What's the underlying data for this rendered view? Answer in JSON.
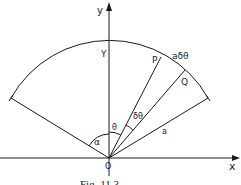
{
  "figure": {
    "caption": "Fig. 11.3",
    "colors": {
      "line": "#1a1a1a",
      "background": "#ffffff"
    }
  },
  "axes": {
    "x_label": "x",
    "y_label": "y",
    "origin_label": "O"
  },
  "points": {
    "top_label": "Y",
    "p_label": "P",
    "q_label": "Q"
  },
  "annotations": {
    "arc_length": "aδθ",
    "theta": "θ",
    "delta_theta": "δθ",
    "radius": "a",
    "alpha": "α"
  }
}
